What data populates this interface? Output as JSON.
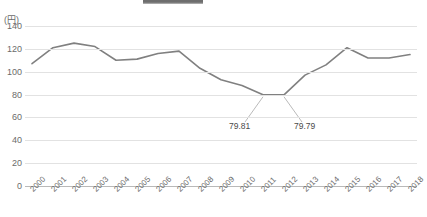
{
  "chart_data": {
    "type": "line",
    "title": "",
    "xlabel": "",
    "ylabel": "(円)",
    "unit_label": "(円)",
    "categories": [
      "2000",
      "2001",
      "2002",
      "2003",
      "2004",
      "2005",
      "2006",
      "2007",
      "2008",
      "2009",
      "2010",
      "2011",
      "2012",
      "2013",
      "2014",
      "2015",
      "2016",
      "2017",
      "2018"
    ],
    "values": [
      107,
      121,
      125,
      122,
      110,
      111,
      116,
      118,
      103,
      93,
      88,
      79.81,
      79.79,
      97,
      106,
      121,
      112,
      112,
      115
    ],
    "series": [
      {
        "name": "",
        "values": [
          107,
          121,
          125,
          122,
          110,
          111,
          116,
          118,
          103,
          93,
          88,
          79.81,
          79.79,
          97,
          106,
          121,
          112,
          112,
          115
        ]
      }
    ],
    "ylim": [
      0,
      140
    ],
    "yticks": [
      "0",
      "20",
      "40",
      "60",
      "80",
      "100",
      "120",
      "140"
    ],
    "ytick_values": [
      0,
      20,
      40,
      60,
      80,
      100,
      120,
      140
    ],
    "grid": true,
    "legend": "none",
    "line_color": "#808080",
    "grid_color": "#e2e2e2",
    "axis_color": "#b9b9b9",
    "text_color": "#6b6b6b",
    "annotations": [
      {
        "label": "79.81",
        "category": "2011",
        "value": 79.81
      },
      {
        "label": "79.79",
        "category": "2012",
        "value": 79.79
      }
    ]
  }
}
